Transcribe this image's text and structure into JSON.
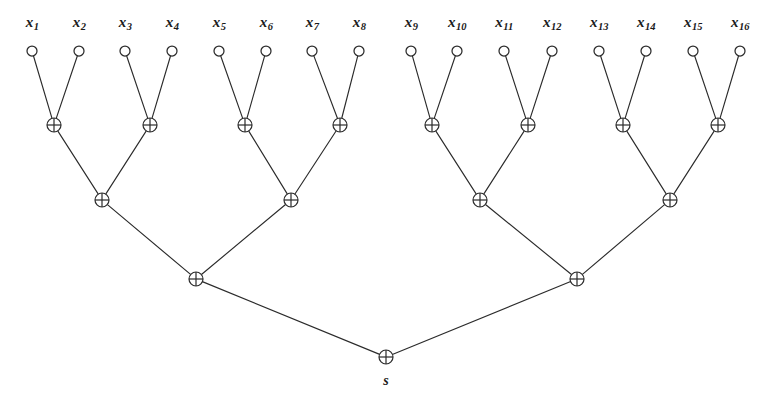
{
  "figure": {
    "background_color": "#ffffff",
    "line_color": "#2b2b2b"
  },
  "inputs": {
    "count": 16,
    "node_icon": "open-circle-icon",
    "label_row_y": 22,
    "node_row_y": 51,
    "node_radius": 5,
    "items": [
      {
        "base": "x",
        "sub": "1",
        "cx": 32
      },
      {
        "base": "x",
        "sub": "2",
        "cx": 79
      },
      {
        "base": "x",
        "sub": "3",
        "cx": 125
      },
      {
        "base": "x",
        "sub": "4",
        "cx": 172
      },
      {
        "base": "x",
        "sub": "5",
        "cx": 219
      },
      {
        "base": "x",
        "sub": "6",
        "cx": 266
      },
      {
        "base": "x",
        "sub": "7",
        "cx": 312
      },
      {
        "base": "x",
        "sub": "8",
        "cx": 359
      },
      {
        "base": "x",
        "sub": "9",
        "cx": 411
      },
      {
        "base": "x",
        "sub": "10",
        "cx": 457
      },
      {
        "base": "x",
        "sub": "11",
        "cx": 504
      },
      {
        "base": "x",
        "sub": "12",
        "cx": 552
      },
      {
        "base": "x",
        "sub": "13",
        "cx": 599
      },
      {
        "base": "x",
        "sub": "14",
        "cx": 646
      },
      {
        "base": "x",
        "sub": "15",
        "cx": 693
      },
      {
        "base": "x",
        "sub": "16",
        "cx": 740
      }
    ]
  },
  "gates": {
    "symbol": "xor-gate-icon",
    "glyph": "circled-plus",
    "radius": 7,
    "levels": [
      {
        "name": "level-1",
        "y": 125,
        "xs": [
          54,
          150,
          245,
          340,
          432,
          528,
          623,
          718
        ]
      },
      {
        "name": "level-2",
        "y": 200,
        "xs": [
          102,
          291,
          480,
          670
        ]
      },
      {
        "name": "level-3",
        "y": 279,
        "xs": [
          196,
          577
        ]
      },
      {
        "name": "level-4-root",
        "y": 357,
        "xs": [
          386
        ]
      }
    ]
  },
  "output": {
    "label": "s",
    "x": 386,
    "y": 381
  }
}
